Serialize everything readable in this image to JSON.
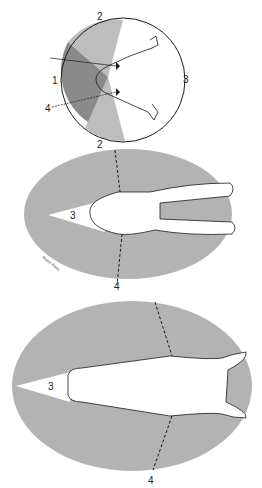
{
  "colors": {
    "light_field": "#bdbdbd",
    "dark_field": "#8a8a8a",
    "ellipse_field": "#b3b3b3",
    "outline": "#1a1a1a",
    "background": "#ffffff"
  },
  "figure_top": {
    "labels": {
      "a": "1",
      "b": "2",
      "c": "3",
      "d": "4",
      "e": "2"
    }
  },
  "figure_middle": {
    "labels": {
      "blind": "3",
      "divider": "4"
    },
    "signature": "Robin Hess"
  },
  "figure_bottom": {
    "labels": {
      "blind": "3",
      "divider": "4"
    }
  }
}
